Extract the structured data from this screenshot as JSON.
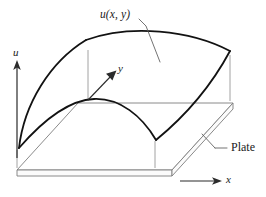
{
  "figure": {
    "type": "math-diagram-3d-surface",
    "caption_labels": {
      "surface_function": "u(x, y)",
      "plate": "Plate"
    },
    "axes": {
      "vertical": {
        "name": "u",
        "label": "u",
        "direction": "up"
      },
      "depth": {
        "name": "y",
        "label": "y",
        "direction": "up-right"
      },
      "horizontal": {
        "name": "x",
        "label": "x",
        "direction": "right"
      }
    },
    "colors": {
      "surface_stroke": "#121212",
      "plate_stroke": "#7d7d7d",
      "axis_stroke": "#2b2b2b",
      "leader_stroke": "#5a5a5a",
      "tick_stroke": "#8a8a8a",
      "background": "#ffffff"
    },
    "stroke_widths": {
      "surface": 1.8,
      "plate": 0.9,
      "axis": 1.2,
      "leader": 0.8,
      "tick": 0.8
    },
    "geometry": {
      "plate_top_corners": [
        [
          17,
          170
        ],
        [
          78,
          103
        ],
        [
          233,
          103
        ],
        [
          172,
          170
        ]
      ],
      "plate_thickness_px": 6,
      "surface_corners": [
        [
          19,
          148
        ],
        [
          86,
          40
        ],
        [
          230,
          51
        ],
        [
          156,
          140
        ]
      ],
      "u_axis": {
        "x": 17,
        "y_top": 62,
        "y_bottom": 158
      },
      "y_axis": {
        "x1": 88,
        "y1": 100,
        "x2": 117,
        "y2": 70
      },
      "x_axis": {
        "x1": 180,
        "y1": 181,
        "x2": 222,
        "y2": 181
      }
    }
  }
}
